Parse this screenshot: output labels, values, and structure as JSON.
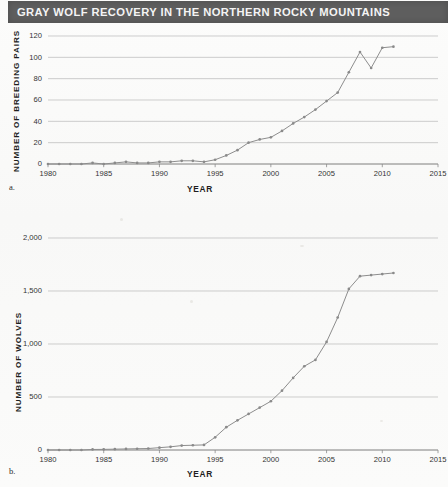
{
  "title": "GRAY WOLF RECOVERY IN THE NORTHERN ROCKY MOUNTAINS",
  "colors": {
    "banner_background": "#5e5e5e",
    "banner_text": "#f4f4f4",
    "page_background": "#fbfbfa",
    "gridline": "#b9b9b9",
    "axis": "#6f6f6f",
    "data_series": "#8a8a8a"
  },
  "panels": [
    {
      "letter": "a.",
      "caption_x": "YEAR",
      "caption_y": "NUMBER OF BREEDING PAIRS"
    },
    {
      "letter": "b.",
      "caption_x": "YEAR",
      "caption_y": "NUMBER OF WOLVES"
    }
  ],
  "chart_data": [
    {
      "type": "line",
      "title": "GRAY WOLF RECOVERY IN THE NORTHERN ROCKY MOUNTAINS",
      "panel": "a.",
      "xlabel": "YEAR",
      "ylabel": "NUMBER OF BREEDING PAIRS",
      "xlim": [
        1980,
        2015
      ],
      "ylim": [
        0,
        120
      ],
      "xticks": [
        1980,
        1985,
        1990,
        1995,
        2000,
        2005,
        2010,
        2015
      ],
      "xtick_labels": [
        "1980",
        "1985",
        "1990",
        "1995",
        "2000",
        "2005",
        "2010",
        "2015"
      ],
      "yticks": [
        0,
        20,
        40,
        60,
        80,
        100,
        120
      ],
      "ytick_labels": [
        "0",
        "20",
        "40",
        "60",
        "80",
        "100",
        "120"
      ],
      "grid": true,
      "legend": "none",
      "markers": true,
      "x": [
        1980,
        1981,
        1982,
        1983,
        1984,
        1985,
        1986,
        1987,
        1988,
        1989,
        1990,
        1991,
        1992,
        1993,
        1994,
        1995,
        1996,
        1997,
        1998,
        1999,
        2000,
        2001,
        2002,
        2003,
        2004,
        2005,
        2006,
        2007,
        2008,
        2009,
        2010,
        2011
      ],
      "y": [
        0,
        0,
        0,
        0,
        1,
        0,
        1,
        2,
        1,
        1,
        2,
        2,
        3,
        3,
        2,
        4,
        8,
        13,
        20,
        23,
        25,
        31,
        38,
        44,
        51,
        59,
        67,
        86,
        105,
        90,
        109,
        110,
        101
      ]
    },
    {
      "type": "line",
      "panel": "b.",
      "xlabel": "YEAR",
      "ylabel": "NUMBER OF WOLVES",
      "xlim": [
        1980,
        2015
      ],
      "ylim": [
        0,
        2000
      ],
      "xticks": [
        1980,
        1985,
        1990,
        1995,
        2000,
        2005,
        2010,
        2015
      ],
      "xtick_labels": [
        "1980",
        "1985",
        "1990",
        "1995",
        "2000",
        "2005",
        "2010",
        "2015"
      ],
      "yticks": [
        0,
        500,
        1000,
        1500,
        2000
      ],
      "ytick_labels": [
        "0",
        "500",
        "1,000",
        "1,500",
        "2,000"
      ],
      "grid": true,
      "legend": "none",
      "markers": true,
      "x": [
        1980,
        1981,
        1982,
        1983,
        1984,
        1985,
        1986,
        1987,
        1988,
        1989,
        1990,
        1991,
        1992,
        1993,
        1994,
        1995,
        1996,
        1997,
        1998,
        1999,
        2000,
        2001,
        2002,
        2003,
        2004,
        2005,
        2006,
        2007,
        2008,
        2009,
        2010,
        2011
      ],
      "y": [
        0,
        0,
        0,
        0,
        5,
        6,
        8,
        10,
        12,
        14,
        22,
        30,
        42,
        45,
        48,
        120,
        215,
        280,
        340,
        400,
        460,
        560,
        680,
        790,
        850,
        1020,
        1250,
        1520,
        1640,
        1650,
        1660,
        1670
      ]
    }
  ]
}
